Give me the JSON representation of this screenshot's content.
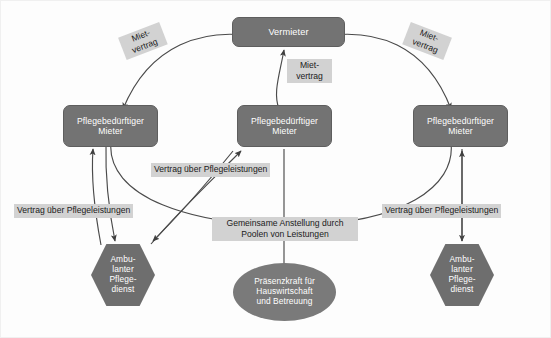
{
  "diagram": {
    "background_color": "#fdfdfd",
    "node_fill": "#737373",
    "node_text_color": "#ffffff",
    "label_fill": "#d2d2d2",
    "label_text_color": "#1b1b1b",
    "line_color": "#4a4a4a"
  },
  "nodes": {
    "landlord": {
      "label": "Vermieter",
      "shape": "rounded-rect"
    },
    "tenant_left": {
      "line1": "Pflegebedürftiger",
      "line2": "Mieter",
      "shape": "rounded-rect"
    },
    "tenant_center": {
      "line1": "Pflegebedürftiger",
      "line2": "Mieter",
      "shape": "rounded-rect"
    },
    "tenant_right": {
      "line1": "Pflegebedürftiger",
      "line2": "Mieter",
      "shape": "rounded-rect"
    },
    "care_left": {
      "line1": "Ambu-",
      "line2": "lanter",
      "line3": "Pflege-",
      "line4": "dienst",
      "shape": "hexagon"
    },
    "care_right": {
      "line1": "Ambu-",
      "line2": "lanter",
      "line3": "Pflege-",
      "line4": "dienst",
      "shape": "hexagon"
    },
    "presence_worker": {
      "line1": "Präsenzkraft für",
      "line2": "Hauswirtschaft",
      "line3": "und Betreuung",
      "shape": "ellipse"
    }
  },
  "edge_labels": {
    "rent_left": {
      "line1": "Miet-",
      "line2": "vertrag"
    },
    "rent_center": {
      "line1": "Miet-",
      "line2": "vertrag"
    },
    "rent_right": {
      "line1": "Miet-",
      "line2": "vertrag"
    },
    "care_contract_left": {
      "text": "Vertrag über Pflegeleistungen"
    },
    "care_contract_middle": {
      "text": "Vertrag über Pflegeleistungen"
    },
    "care_contract_right": {
      "text": "Vertrag über Pflegeleistungen"
    },
    "pooling": {
      "line1": "Gemeinsame Anstellung durch",
      "line2": "Poolen von Leistungen"
    }
  }
}
